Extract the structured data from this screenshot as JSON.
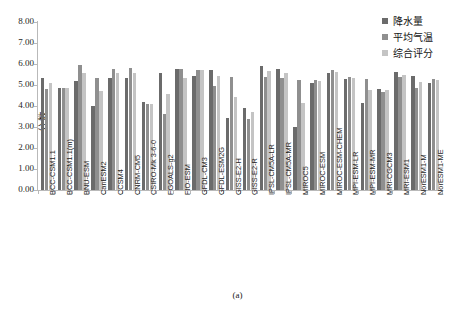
{
  "header_cut_text": "",
  "caption": "(a)",
  "legend": {
    "items": [
      {
        "label": "降水量",
        "color": "#6b6b6b"
      },
      {
        "label": "平均气温",
        "color": "#8f8f8f"
      },
      {
        "label": "综合评分",
        "color": "#c4c4c4"
      }
    ]
  },
  "chart_data": {
    "type": "bar",
    "title": "",
    "xlabel": "",
    "ylabel": "分数",
    "ylim": [
      0.0,
      8.0
    ],
    "ytick_labels": [
      "8.00",
      "7.00",
      "6.00",
      "5.00",
      "4.00",
      "3.00",
      "2.00",
      "1.00",
      "0.00"
    ],
    "ytick_values": [
      8,
      7,
      6,
      5,
      4,
      3,
      2,
      1,
      0
    ],
    "grid": false,
    "legend_position": "top-right",
    "categories": [
      "BCC-CSM1.1",
      "BCC-CSM1.1(m)",
      "BNU-ESM",
      "CanESM2",
      "CCSM4",
      "CNRM-CM5",
      "CSIRO-Mk 3-6-0",
      "FGOALS-g2",
      "FIO-ESM",
      "GFDL-CM3",
      "GFDL-ESM2G",
      "GISS-E2-H",
      "GISS-E2-R",
      "IPSL-CM5A-LR",
      "IPSL-CM5A-MR",
      "MIROC5",
      "MIROC-ESM",
      "MIROC-ESM-CHEM",
      "MPI-ESM-LR",
      "MPI-ESM-MR",
      "MRI-CGCM3",
      "MRI-ESM1",
      "NorESM1-M",
      "NorESM1-ME"
    ],
    "series": [
      {
        "name": "降水量",
        "color": "#6b6b6b",
        "values": [
          5.35,
          4.85,
          5.2,
          4.0,
          5.35,
          5.35,
          4.2,
          5.55,
          5.75,
          5.45,
          5.7,
          3.45,
          3.9,
          5.9,
          5.75,
          3.0,
          5.1,
          5.55,
          5.3,
          4.15,
          4.8,
          5.6,
          5.45,
          5.1
        ]
      },
      {
        "name": "平均气温",
        "color": "#8f8f8f",
        "values": [
          4.8,
          4.85,
          5.95,
          5.35,
          5.75,
          5.8,
          4.1,
          3.6,
          5.75,
          5.7,
          4.95,
          5.4,
          3.4,
          5.4,
          5.35,
          5.25,
          5.25,
          5.7,
          5.4,
          5.3,
          4.65,
          5.4,
          4.85,
          5.3
        ]
      },
      {
        "name": "综合评分",
        "color": "#c4c4c4",
        "values": [
          5.1,
          4.85,
          5.55,
          4.7,
          5.55,
          5.55,
          4.1,
          4.55,
          5.35,
          5.7,
          5.45,
          4.45,
          3.7,
          5.65,
          5.55,
          4.15,
          5.2,
          5.6,
          5.35,
          4.75,
          4.75,
          5.5,
          5.15,
          5.25
        ]
      }
    ]
  }
}
